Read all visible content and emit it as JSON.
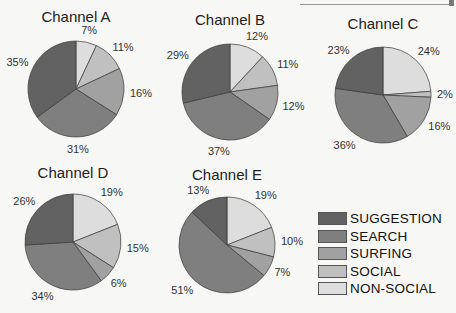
{
  "chart_data": {
    "type": "pie",
    "categories": [
      "NON-SOCIAL",
      "SOCIAL",
      "SURFING",
      "SEARCH",
      "SUGGESTION"
    ],
    "colors": {
      "SUGGESTION": "#626262",
      "SEARCH": "#7f7f7f",
      "SURFING": "#a1a1a1",
      "SOCIAL": "#c0c0c0",
      "NON-SOCIAL": "#dddddd"
    },
    "start_angle": "12 o'clock, clockwise",
    "pies": [
      {
        "title": "Channel A",
        "cx": 76,
        "cy": 89,
        "r": 48,
        "title_y": 22,
        "values": {
          "NON-SOCIAL": 7,
          "SOCIAL": 11,
          "SURFING": 16,
          "SEARCH": 31,
          "SUGGESTION": 35
        }
      },
      {
        "title": "Channel B",
        "cx": 230,
        "cy": 92,
        "r": 48,
        "title_y": 25,
        "values": {
          "NON-SOCIAL": 12,
          "SOCIAL": 11,
          "SURFING": 12,
          "SEARCH": 37,
          "SUGGESTION": 29
        }
      },
      {
        "title": "Channel C",
        "cx": 383,
        "cy": 95,
        "r": 48,
        "title_y": 29,
        "values": {
          "NON-SOCIAL": 24,
          "SOCIAL": 2,
          "SURFING": 16,
          "SEARCH": 36,
          "SUGGESTION": 23
        }
      },
      {
        "title": "Channel D",
        "cx": 73,
        "cy": 242,
        "r": 48,
        "title_y": 178,
        "values": {
          "NON-SOCIAL": 19,
          "SOCIAL": 15,
          "SURFING": 6,
          "SEARCH": 34,
          "SUGGESTION": 26
        }
      },
      {
        "title": "Channel E",
        "cx": 227,
        "cy": 245,
        "r": 48,
        "title_y": 180,
        "values": {
          "NON-SOCIAL": 19,
          "SOCIAL": 10,
          "SURFING": 7,
          "SEARCH": 51,
          "SUGGESTION": 13
        }
      }
    ],
    "legend": {
      "position": "bottom-right",
      "order": [
        "SUGGESTION",
        "SEARCH",
        "SURFING",
        "SOCIAL",
        "NON-SOCIAL"
      ]
    }
  },
  "legend": {
    "items": [
      {
        "label": "SUGGESTION",
        "color": "#626262"
      },
      {
        "label": "SEARCH",
        "color": "#7f7f7f"
      },
      {
        "label": "SURFING",
        "color": "#a1a1a1"
      },
      {
        "label": "SOCIAL",
        "color": "#c0c0c0"
      },
      {
        "label": "NON-SOCIAL",
        "color": "#dddddd"
      }
    ]
  }
}
